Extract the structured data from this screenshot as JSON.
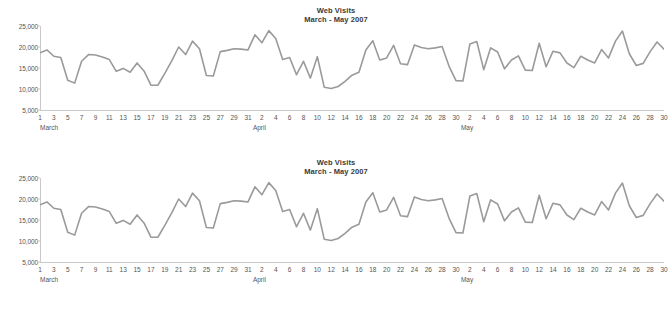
{
  "chart_data": [
    {
      "type": "line",
      "title": "Web Visits",
      "subtitle": "March - May 2007",
      "xlabel": "",
      "ylabel": "",
      "ylim": [
        5000,
        25000
      ],
      "ytick_values": [
        5000,
        10000,
        15000,
        20000,
        25000
      ],
      "ytick_labels": [
        "5,000",
        "10,000",
        "15,000",
        "20,000",
        "25,000"
      ],
      "grid": false,
      "legend": "none",
      "line_color": "#9a9a9a",
      "months": [
        {
          "name": "March",
          "start_index": 0,
          "days": 31
        },
        {
          "name": "April",
          "start_index": 31,
          "days": 30
        },
        {
          "name": "May",
          "start_index": 61,
          "days": 31
        }
      ],
      "x": [
        "Mar 1",
        "Mar 2",
        "Mar 3",
        "Mar 4",
        "Mar 5",
        "Mar 6",
        "Mar 7",
        "Mar 8",
        "Mar 9",
        "Mar 10",
        "Mar 11",
        "Mar 12",
        "Mar 13",
        "Mar 14",
        "Mar 15",
        "Mar 16",
        "Mar 17",
        "Mar 18",
        "Mar 19",
        "Mar 20",
        "Mar 21",
        "Mar 22",
        "Mar 23",
        "Mar 24",
        "Mar 25",
        "Mar 26",
        "Mar 27",
        "Mar 28",
        "Mar 29",
        "Mar 30",
        "Mar 31",
        "Apr 1",
        "Apr 2",
        "Apr 3",
        "Apr 4",
        "Apr 5",
        "Apr 6",
        "Apr 7",
        "Apr 8",
        "Apr 9",
        "Apr 10",
        "Apr 11",
        "Apr 12",
        "Apr 13",
        "Apr 14",
        "Apr 15",
        "Apr 16",
        "Apr 17",
        "Apr 18",
        "Apr 19",
        "Apr 20",
        "Apr 21",
        "Apr 22",
        "Apr 23",
        "Apr 24",
        "Apr 25",
        "Apr 26",
        "Apr 27",
        "Apr 28",
        "Apr 29",
        "Apr 30",
        "May 1",
        "May 2",
        "May 3",
        "May 4",
        "May 5",
        "May 6",
        "May 7",
        "May 8",
        "May 9",
        "May 10",
        "May 11",
        "May 12",
        "May 13",
        "May 14",
        "May 15",
        "May 16",
        "May 17",
        "May 18",
        "May 19",
        "May 20",
        "May 21",
        "May 22",
        "May 23",
        "May 24",
        "May 25",
        "May 26",
        "May 27",
        "May 28",
        "May 29",
        "May 30",
        "May 31"
      ],
      "x_tick_labels": [
        "1",
        "",
        "3",
        "",
        "5",
        "",
        "7",
        "",
        "9",
        "",
        "11",
        "",
        "13",
        "",
        "15",
        "",
        "17",
        "",
        "19",
        "",
        "21",
        "",
        "23",
        "",
        "25",
        "",
        "27",
        "",
        "29",
        "",
        "31",
        "",
        "2",
        "",
        "4",
        "",
        "6",
        "",
        "8",
        "",
        "10",
        "",
        "12",
        "",
        "14",
        "",
        "16",
        "",
        "18",
        "",
        "20",
        "",
        "22",
        "",
        "24",
        "",
        "26",
        "",
        "28",
        "",
        "30",
        "",
        "2",
        "",
        "4",
        "",
        "6",
        "",
        "8",
        "",
        "10",
        "",
        "12",
        "",
        "14",
        "",
        "16",
        "",
        "18",
        "",
        "20",
        "",
        "22",
        "",
        "24",
        "",
        "26",
        "",
        "28",
        "",
        "30",
        ""
      ],
      "values": [
        18600,
        19300,
        17800,
        17500,
        12100,
        11400,
        16600,
        18200,
        18100,
        17600,
        17000,
        14200,
        14900,
        14000,
        16200,
        14300,
        10900,
        10900,
        13700,
        16700,
        20000,
        18200,
        21400,
        19600,
        13200,
        13100,
        18900,
        19200,
        19600,
        19500,
        19300,
        22900,
        21000,
        23900,
        22000,
        17000,
        17500,
        13400,
        16600,
        12600,
        17700,
        10400,
        10100,
        10600,
        11800,
        13300,
        14000,
        19300,
        21500,
        16900,
        17400,
        20400,
        16000,
        15800,
        20500,
        19900,
        19600,
        19800,
        20100,
        15400,
        12000,
        11900,
        20700,
        21300,
        14600,
        19800,
        18800,
        14800,
        16900,
        17900,
        14500,
        14400,
        20900,
        15300,
        19000,
        18600,
        16200,
        15100,
        17800,
        16900,
        16200,
        19400,
        17400,
        21400,
        23800,
        18400,
        15600,
        16100,
        18900,
        21200,
        19500
      ]
    },
    {
      "type": "line",
      "title": "Web Visits",
      "subtitle": "March - May 2007",
      "xlabel": "",
      "ylabel": "",
      "ylim": [
        5000,
        25000
      ],
      "ytick_values": [
        5000,
        10000,
        15000,
        20000,
        25000
      ],
      "ytick_labels": [
        "5,000",
        "10,000",
        "15,000",
        "20,000",
        "25,000"
      ],
      "grid": false,
      "legend": "none",
      "line_color": "#9a9a9a",
      "months": [
        {
          "name": "March",
          "start_index": 0,
          "days": 31
        },
        {
          "name": "April",
          "start_index": 31,
          "days": 30
        },
        {
          "name": "May",
          "start_index": 61,
          "days": 31
        }
      ],
      "x": [
        "Mar 1",
        "Mar 2",
        "Mar 3",
        "Mar 4",
        "Mar 5",
        "Mar 6",
        "Mar 7",
        "Mar 8",
        "Mar 9",
        "Mar 10",
        "Mar 11",
        "Mar 12",
        "Mar 13",
        "Mar 14",
        "Mar 15",
        "Mar 16",
        "Mar 17",
        "Mar 18",
        "Mar 19",
        "Mar 20",
        "Mar 21",
        "Mar 22",
        "Mar 23",
        "Mar 24",
        "Mar 25",
        "Mar 26",
        "Mar 27",
        "Mar 28",
        "Mar 29",
        "Mar 30",
        "Mar 31",
        "Apr 1",
        "Apr 2",
        "Apr 3",
        "Apr 4",
        "Apr 5",
        "Apr 6",
        "Apr 7",
        "Apr 8",
        "Apr 9",
        "Apr 10",
        "Apr 11",
        "Apr 12",
        "Apr 13",
        "Apr 14",
        "Apr 15",
        "Apr 16",
        "Apr 17",
        "Apr 18",
        "Apr 19",
        "Apr 20",
        "Apr 21",
        "Apr 22",
        "Apr 23",
        "Apr 24",
        "Apr 25",
        "Apr 26",
        "Apr 27",
        "Apr 28",
        "Apr 29",
        "Apr 30",
        "May 1",
        "May 2",
        "May 3",
        "May 4",
        "May 5",
        "May 6",
        "May 7",
        "May 8",
        "May 9",
        "May 10",
        "May 11",
        "May 12",
        "May 13",
        "May 14",
        "May 15",
        "May 16",
        "May 17",
        "May 18",
        "May 19",
        "May 20",
        "May 21",
        "May 22",
        "May 23",
        "May 24",
        "May 25",
        "May 26",
        "May 27",
        "May 28",
        "May 29",
        "May 30",
        "May 31"
      ],
      "x_tick_labels": [
        "1",
        "",
        "3",
        "",
        "5",
        "",
        "7",
        "",
        "9",
        "",
        "11",
        "",
        "13",
        "",
        "15",
        "",
        "17",
        "",
        "19",
        "",
        "21",
        "",
        "23",
        "",
        "25",
        "",
        "27",
        "",
        "29",
        "",
        "31",
        "",
        "2",
        "",
        "4",
        "",
        "6",
        "",
        "8",
        "",
        "10",
        "",
        "12",
        "",
        "14",
        "",
        "16",
        "",
        "18",
        "",
        "20",
        "",
        "22",
        "",
        "24",
        "",
        "26",
        "",
        "28",
        "",
        "30",
        "",
        "2",
        "",
        "4",
        "",
        "6",
        "",
        "8",
        "",
        "10",
        "",
        "12",
        "",
        "14",
        "",
        "16",
        "",
        "18",
        "",
        "20",
        "",
        "22",
        "",
        "24",
        "",
        "26",
        "",
        "28",
        "",
        "30",
        ""
      ],
      "values": [
        18600,
        19300,
        17800,
        17500,
        12100,
        11400,
        16600,
        18200,
        18100,
        17600,
        17000,
        14200,
        14900,
        14000,
        16200,
        14300,
        10900,
        10900,
        13700,
        16700,
        20000,
        18200,
        21400,
        19600,
        13200,
        13100,
        18900,
        19200,
        19600,
        19500,
        19300,
        22900,
        21000,
        23900,
        22000,
        17000,
        17500,
        13400,
        16600,
        12600,
        17700,
        10400,
        10100,
        10600,
        11800,
        13300,
        14000,
        19300,
        21500,
        16900,
        17400,
        20400,
        16000,
        15800,
        20500,
        19900,
        19600,
        19800,
        20100,
        15400,
        12000,
        11900,
        20700,
        21300,
        14600,
        19800,
        18800,
        14800,
        16900,
        17900,
        14500,
        14400,
        20900,
        15300,
        19000,
        18600,
        16200,
        15100,
        17800,
        16900,
        16200,
        19400,
        17400,
        21400,
        23800,
        18400,
        15600,
        16100,
        18900,
        21200,
        19500
      ]
    }
  ]
}
